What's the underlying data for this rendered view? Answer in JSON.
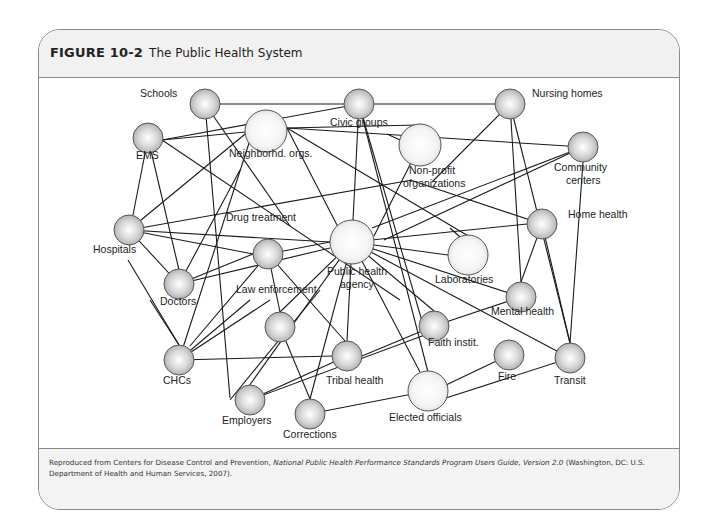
{
  "figure": {
    "number_label": "FIGURE 10-2",
    "title": "The Public Health System"
  },
  "caption": {
    "prefix": "Reproduced from Centers for Disease Control and Prevention, ",
    "italic": "National Public Health Performance Standards Program Users Guide, Version 2.0",
    "suffix": " (Washington, DC: U.S. Department of Health and Human Services, 2007)."
  },
  "colors": {
    "node_fill_small": "#c9c9c9",
    "node_fill_large": "#f2f2f2",
    "node_stroke": "#555555",
    "edge": "#1a1a1a",
    "frame": "#8a8a8a",
    "header_bg": "#f1f1f1"
  },
  "nodes": [
    {
      "id": "schools",
      "x": 205,
      "y": 104,
      "r": 15,
      "large": false
    },
    {
      "id": "neighborhd",
      "x": 266,
      "y": 131,
      "r": 21,
      "large": true
    },
    {
      "id": "civic",
      "x": 359,
      "y": 104,
      "r": 15,
      "large": false
    },
    {
      "id": "nursing",
      "x": 510,
      "y": 104,
      "r": 15,
      "large": false
    },
    {
      "id": "nonprofit",
      "x": 420,
      "y": 145,
      "r": 21,
      "large": true
    },
    {
      "id": "community",
      "x": 583,
      "y": 147,
      "r": 15,
      "large": false
    },
    {
      "id": "ems",
      "x": 148,
      "y": 138,
      "r": 15,
      "large": false
    },
    {
      "id": "hospitals",
      "x": 129,
      "y": 230,
      "r": 15,
      "large": false
    },
    {
      "id": "pha",
      "x": 352,
      "y": 242,
      "r": 22,
      "large": true
    },
    {
      "id": "homehealth",
      "x": 542,
      "y": 224,
      "r": 15,
      "large": false
    },
    {
      "id": "labs",
      "x": 468,
      "y": 255,
      "r": 20,
      "large": true
    },
    {
      "id": "drug",
      "x": 268,
      "y": 254,
      "r": 15,
      "large": false
    },
    {
      "id": "doctors",
      "x": 179,
      "y": 284,
      "r": 15,
      "large": false
    },
    {
      "id": "mental",
      "x": 521,
      "y": 297,
      "r": 15,
      "large": false
    },
    {
      "id": "law",
      "x": 280,
      "y": 327,
      "r": 15,
      "large": false
    },
    {
      "id": "faith",
      "x": 434,
      "y": 326,
      "r": 15,
      "large": false
    },
    {
      "id": "chcs",
      "x": 179,
      "y": 360,
      "r": 15,
      "large": false
    },
    {
      "id": "tribal",
      "x": 347,
      "y": 356,
      "r": 15,
      "large": false
    },
    {
      "id": "fire",
      "x": 509,
      "y": 355,
      "r": 15,
      "large": false
    },
    {
      "id": "transit",
      "x": 570,
      "y": 358,
      "r": 15,
      "large": false
    },
    {
      "id": "elected",
      "x": 428,
      "y": 391,
      "r": 20,
      "large": true
    },
    {
      "id": "employers",
      "x": 250,
      "y": 400,
      "r": 15,
      "large": false
    },
    {
      "id": "corrections",
      "x": 310,
      "y": 414,
      "r": 15,
      "large": false
    }
  ],
  "edges": [
    [
      205,
      104,
      359,
      104
    ],
    [
      205,
      104,
      230,
      398
    ],
    [
      205,
      104,
      290,
      226
    ],
    [
      162,
      140,
      287,
      128
    ],
    [
      162,
      140,
      359,
      104
    ],
    [
      162,
      140,
      400,
      300
    ],
    [
      287,
      128,
      583,
      147
    ],
    [
      287,
      128,
      355,
      260
    ],
    [
      287,
      128,
      475,
      240
    ],
    [
      148,
      138,
      133,
      215
    ],
    [
      148,
      138,
      179,
      270
    ],
    [
      359,
      104,
      510,
      104
    ],
    [
      359,
      104,
      353,
      220
    ],
    [
      359,
      104,
      424,
      328
    ],
    [
      359,
      104,
      428,
      372
    ],
    [
      287,
      128,
      418,
      125
    ],
    [
      387,
      134,
      400,
      140
    ],
    [
      510,
      104,
      521,
      282
    ],
    [
      510,
      104,
      570,
      343
    ],
    [
      510,
      104,
      432,
      182
    ],
    [
      583,
      147,
      384,
      240
    ],
    [
      583,
      147,
      372,
      228
    ],
    [
      420,
      145,
      374,
      236
    ],
    [
      450,
      228,
      460,
      237
    ],
    [
      129,
      230,
      330,
      242
    ],
    [
      129,
      230,
      253,
      254
    ],
    [
      129,
      230,
      179,
      284
    ],
    [
      129,
      230,
      250,
      130
    ],
    [
      129,
      230,
      412,
      180
    ],
    [
      150,
      300,
      179,
      345
    ],
    [
      128,
      260,
      179,
      345
    ],
    [
      179,
      284,
      253,
      254
    ],
    [
      179,
      284,
      330,
      248
    ],
    [
      179,
      284,
      240,
      170
    ],
    [
      268,
      254,
      330,
      242
    ],
    [
      268,
      254,
      280,
      312
    ],
    [
      268,
      254,
      345,
      341
    ],
    [
      268,
      254,
      190,
      346
    ],
    [
      179,
      360,
      250,
      300
    ],
    [
      179,
      360,
      333,
      356
    ],
    [
      179,
      360,
      270,
      300
    ],
    [
      179,
      360,
      250,
      140
    ],
    [
      352,
      242,
      527,
      224
    ],
    [
      352,
      242,
      448,
      255
    ],
    [
      352,
      242,
      521,
      297
    ],
    [
      352,
      242,
      434,
      311
    ],
    [
      352,
      242,
      570,
      358
    ],
    [
      352,
      242,
      249,
      386
    ],
    [
      352,
      242,
      310,
      399
    ],
    [
      352,
      242,
      347,
      341
    ],
    [
      352,
      242,
      420,
      372
    ],
    [
      352,
      242,
      280,
      312
    ],
    [
      542,
      224,
      521,
      282
    ],
    [
      542,
      224,
      570,
      343
    ],
    [
      542,
      224,
      410,
      180
    ],
    [
      521,
      297,
      434,
      326
    ],
    [
      583,
      162,
      570,
      343
    ],
    [
      449,
      326,
      250,
      400
    ],
    [
      362,
      356,
      434,
      326
    ],
    [
      428,
      391,
      309,
      414
    ],
    [
      446,
      385,
      509,
      355
    ],
    [
      446,
      398,
      570,
      358
    ],
    [
      280,
      327,
      310,
      399
    ],
    [
      250,
      400,
      347,
      356
    ],
    [
      320,
      290,
      230,
      400
    ]
  ],
  "labels": [
    {
      "id": "schools",
      "text": "Schools",
      "x": 140,
      "y": 97
    },
    {
      "id": "neighborhd",
      "text": "Neighborhd. orgs.",
      "x": 229,
      "y": 157
    },
    {
      "id": "civic",
      "text": "Civic groups",
      "x": 330,
      "y": 126
    },
    {
      "id": "nursing",
      "text": "Nursing homes",
      "x": 532,
      "y": 97
    },
    {
      "id": "nonprofit_1",
      "text": "Non-profit",
      "x": 409,
      "y": 174
    },
    {
      "id": "nonprofit_2",
      "text": "organizations",
      "x": 403,
      "y": 187
    },
    {
      "id": "community_1",
      "text": "Community",
      "x": 554,
      "y": 171
    },
    {
      "id": "community_2",
      "text": "centers",
      "x": 566,
      "y": 184
    },
    {
      "id": "ems",
      "text": "EMS",
      "x": 136,
      "y": 159
    },
    {
      "id": "drug",
      "text": "Drug treatment",
      "x": 226,
      "y": 221
    },
    {
      "id": "homehealth",
      "text": "Home health",
      "x": 568,
      "y": 218
    },
    {
      "id": "hospitals",
      "text": "Hospitals",
      "x": 93,
      "y": 253
    },
    {
      "id": "pha_1",
      "text": "Public health",
      "x": 327,
      "y": 275
    },
    {
      "id": "pha_2",
      "text": "agency",
      "x": 340,
      "y": 288
    },
    {
      "id": "labs",
      "text": "Laboratories",
      "x": 435,
      "y": 283
    },
    {
      "id": "law",
      "text": "Law enforcement",
      "x": 236,
      "y": 293
    },
    {
      "id": "mental",
      "text": "Mental health",
      "x": 491,
      "y": 315
    },
    {
      "id": "doctors",
      "text": "Doctors",
      "x": 160,
      "y": 305
    },
    {
      "id": "faith",
      "text": "Faith instit.",
      "x": 428,
      "y": 346
    },
    {
      "id": "fire",
      "text": "Fire",
      "x": 498,
      "y": 380
    },
    {
      "id": "transit",
      "text": "Transit",
      "x": 554,
      "y": 384
    },
    {
      "id": "chcs",
      "text": "CHCs",
      "x": 163,
      "y": 384
    },
    {
      "id": "tribal",
      "text": "Tribal health",
      "x": 326,
      "y": 384
    },
    {
      "id": "employers",
      "text": "Employers",
      "x": 222,
      "y": 424
    },
    {
      "id": "elected",
      "text": "Elected officials",
      "x": 389,
      "y": 421
    },
    {
      "id": "corrections",
      "text": "Corrections",
      "x": 283,
      "y": 438
    }
  ]
}
